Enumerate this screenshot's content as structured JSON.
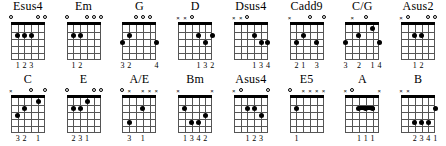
{
  "chart_data": {
    "type": "diagram",
    "diagram_kind": "guitar-chord-diagrams",
    "strings": 6,
    "frets": 5,
    "rows": [
      {
        "chords": [
          {
            "name": "Esus4",
            "markers": [
              "o",
              "",
              "",
              "",
              "o",
              "o"
            ],
            "dots": [
              {
                "string": 5,
                "fret": 2
              },
              {
                "string": 4,
                "fret": 2
              },
              {
                "string": 3,
                "fret": 2
              }
            ],
            "barre": null,
            "fingering": [
              "",
              "1",
              "2",
              "3",
              "",
              ""
            ]
          },
          {
            "name": "Em",
            "markers": [
              "o",
              "",
              "",
              "o",
              "o",
              "o"
            ],
            "dots": [
              {
                "string": 5,
                "fret": 2
              },
              {
                "string": 4,
                "fret": 2
              }
            ],
            "barre": null,
            "fingering": [
              "",
              "1",
              "2",
              "",
              "",
              ""
            ]
          },
          {
            "name": "G",
            "markers": [
              "",
              "",
              "o",
              "o",
              "o",
              ""
            ],
            "dots": [
              {
                "string": 6,
                "fret": 3
              },
              {
                "string": 5,
                "fret": 2
              },
              {
                "string": 1,
                "fret": 3
              }
            ],
            "barre": null,
            "fingering": [
              "3",
              "2",
              "",
              "",
              "",
              "4"
            ]
          },
          {
            "name": "D",
            "markers": [
              "x",
              "x",
              "o",
              "",
              "",
              ""
            ],
            "dots": [
              {
                "string": 3,
                "fret": 2
              },
              {
                "string": 1,
                "fret": 2
              },
              {
                "string": 2,
                "fret": 3
              }
            ],
            "barre": null,
            "fingering": [
              "",
              "",
              "",
              "1",
              "3",
              "2"
            ]
          },
          {
            "name": "Dsus4",
            "markers": [
              "x",
              "x",
              "o",
              "",
              "",
              ""
            ],
            "dots": [
              {
                "string": 3,
                "fret": 2
              },
              {
                "string": 2,
                "fret": 3
              },
              {
                "string": 1,
                "fret": 3
              }
            ],
            "barre": null,
            "fingering": [
              "",
              "",
              "",
              "1",
              "3",
              "4"
            ]
          },
          {
            "name": "Cadd9",
            "markers": [
              "x",
              "",
              "",
              "o",
              "",
              "o"
            ],
            "dots": [
              {
                "string": 5,
                "fret": 3
              },
              {
                "string": 4,
                "fret": 2
              },
              {
                "string": 2,
                "fret": 3
              }
            ],
            "barre": null,
            "fingering": [
              "",
              "2",
              "1",
              "",
              "3",
              ""
            ]
          },
          {
            "name": "C/G",
            "markers": [
              "",
              "x",
              "",
              "o",
              "",
              ""
            ],
            "dots": [
              {
                "string": 6,
                "fret": 3
              },
              {
                "string": 4,
                "fret": 2
              },
              {
                "string": 2,
                "fret": 1
              },
              {
                "string": 1,
                "fret": 3
              }
            ],
            "barre": null,
            "fingering": [
              "3",
              "",
              "2",
              "",
              "1",
              "4"
            ]
          },
          {
            "name": "Asus2",
            "markers": [
              "x",
              "o",
              "",
              "",
              "o",
              "o"
            ],
            "dots": [
              {
                "string": 4,
                "fret": 2
              },
              {
                "string": 3,
                "fret": 2
              }
            ],
            "barre": null,
            "fingering": [
              "",
              "",
              "1",
              "2",
              "",
              ""
            ]
          }
        ]
      },
      {
        "chords": [
          {
            "name": "C",
            "markers": [
              "x",
              "",
              "",
              "o",
              "",
              "o"
            ],
            "dots": [
              {
                "string": 5,
                "fret": 3
              },
              {
                "string": 4,
                "fret": 2
              },
              {
                "string": 2,
                "fret": 1
              }
            ],
            "barre": null,
            "fingering": [
              "",
              "3",
              "2",
              "",
              "1",
              ""
            ]
          },
          {
            "name": "E",
            "markers": [
              "o",
              "",
              "",
              "",
              "o",
              "o"
            ],
            "dots": [
              {
                "string": 5,
                "fret": 2
              },
              {
                "string": 4,
                "fret": 2
              },
              {
                "string": 3,
                "fret": 1
              }
            ],
            "barre": null,
            "fingering": [
              "",
              "2",
              "3",
              "1",
              "",
              ""
            ]
          },
          {
            "name": "A/E",
            "markers": [
              "o",
              "x",
              "",
              "x",
              "x",
              "x"
            ],
            "dots": [
              {
                "string": 3,
                "fret": 2
              },
              {
                "string": 5,
                "fret": 4
              }
            ],
            "barre": null,
            "fingering": [
              "",
              "3",
              "",
              "1",
              "",
              ""
            ]
          },
          {
            "name": "Bm",
            "markers": [
              "x",
              "",
              "",
              "",
              "",
              "x"
            ],
            "dots": [
              {
                "string": 5,
                "fret": 2
              },
              {
                "string": 4,
                "fret": 4
              },
              {
                "string": 3,
                "fret": 4
              },
              {
                "string": 2,
                "fret": 3
              }
            ],
            "barre": null,
            "fingering": [
              "",
              "1",
              "3",
              "4",
              "2",
              ""
            ]
          },
          {
            "name": "Asus4",
            "markers": [
              "x",
              "o",
              "",
              "",
              "",
              "o"
            ],
            "dots": [
              {
                "string": 4,
                "fret": 2
              },
              {
                "string": 3,
                "fret": 2
              },
              {
                "string": 2,
                "fret": 3
              }
            ],
            "barre": null,
            "fingering": [
              "",
              "",
              "1",
              "2",
              "3",
              ""
            ]
          },
          {
            "name": "E5",
            "markers": [
              "o",
              "",
              "x",
              "x",
              "x",
              "x"
            ],
            "dots": [
              {
                "string": 5,
                "fret": 2
              }
            ],
            "barre": null,
            "fingering": [
              "",
              "1",
              "",
              "",
              "",
              ""
            ]
          },
          {
            "name": "A",
            "markers": [
              "x",
              "o",
              "",
              "",
              "",
              "x"
            ],
            "dots": [
              {
                "string": 4,
                "fret": 2
              },
              {
                "string": 3,
                "fret": 2
              },
              {
                "string": 2,
                "fret": 2
              }
            ],
            "barre": {
              "fret": 2,
              "from_string": 4,
              "to_string": 2
            },
            "fingering": [
              "",
              "",
              "1",
              "1",
              "1",
              ""
            ]
          },
          {
            "name": "B",
            "markers": [
              "x",
              "x",
              "",
              "",
              "",
              ""
            ],
            "dots": [
              {
                "string": 1,
                "fret": 2
              },
              {
                "string": 4,
                "fret": 4
              },
              {
                "string": 3,
                "fret": 4
              },
              {
                "string": 2,
                "fret": 4
              }
            ],
            "barre": null,
            "fingering": [
              "",
              "",
              "2",
              "3",
              "4",
              "1"
            ]
          }
        ]
      }
    ]
  }
}
